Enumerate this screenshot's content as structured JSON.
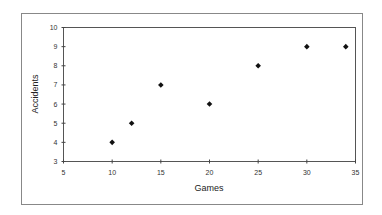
{
  "chart_data": {
    "type": "scatter",
    "title": "",
    "xlabel": "Games",
    "ylabel": "Accidents",
    "xlim": [
      5,
      35
    ],
    "ylim": [
      3,
      10
    ],
    "xticks": [
      5,
      10,
      15,
      20,
      25,
      30,
      35
    ],
    "yticks": [
      3,
      4,
      5,
      6,
      7,
      8,
      9,
      10
    ],
    "grid": false,
    "legend": null,
    "marker": "diamond",
    "series": [
      {
        "name": "Accidents",
        "color": "#111111",
        "points": [
          {
            "x": 10,
            "y": 4
          },
          {
            "x": 12,
            "y": 5
          },
          {
            "x": 15,
            "y": 7
          },
          {
            "x": 20,
            "y": 6
          },
          {
            "x": 25,
            "y": 8
          },
          {
            "x": 30,
            "y": 9
          },
          {
            "x": 34,
            "y": 9
          }
        ]
      }
    ]
  },
  "style": {
    "frame_color": "#888888",
    "axis_color": "#444444",
    "marker_color": "#111111"
  }
}
